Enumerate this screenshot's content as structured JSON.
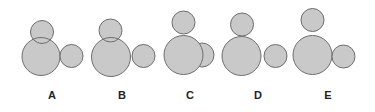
{
  "figure": {
    "style": {
      "circle_fill": "#c9c9c9",
      "circle_stroke": "#6e6e6e",
      "label_color": "#222222"
    },
    "options": [
      {
        "label": "A",
        "label_x": 52,
        "label_y": 99,
        "circles": [
          {
            "role": "large",
            "cx": 41,
            "cy": 56.5,
            "r": 19
          },
          {
            "role": "right",
            "cx": 71.5,
            "cy": 56,
            "r": 11.5
          },
          {
            "role": "top",
            "cx": 42,
            "cy": 32,
            "r": 11.5,
            "overlaps_large": true
          }
        ]
      },
      {
        "label": "B",
        "label_x": 122,
        "label_y": 99,
        "circles": [
          {
            "role": "large",
            "cx": 111,
            "cy": 57,
            "r": 19.5
          },
          {
            "role": "right",
            "cx": 143.5,
            "cy": 56,
            "r": 11.5
          },
          {
            "role": "top",
            "cx": 110.5,
            "cy": 30.5,
            "r": 11.5,
            "overlaps_large": true
          }
        ]
      },
      {
        "label": "C",
        "label_x": 190,
        "label_y": 99,
        "circles": [
          {
            "role": "right",
            "cx": 202,
            "cy": 55,
            "r": 12
          },
          {
            "role": "top",
            "cx": 183.5,
            "cy": 22.5,
            "r": 11.5
          },
          {
            "role": "large",
            "cx": 183.5,
            "cy": 55,
            "r": 19.5
          }
        ]
      },
      {
        "label": "D",
        "label_x": 258,
        "label_y": 99,
        "circles": [
          {
            "role": "large",
            "cx": 241.5,
            "cy": 56,
            "r": 19.5
          },
          {
            "role": "right",
            "cx": 275.5,
            "cy": 56,
            "r": 11.5
          },
          {
            "role": "top",
            "cx": 242,
            "cy": 24.5,
            "r": 11.5
          }
        ]
      },
      {
        "label": "E",
        "label_x": 328,
        "label_y": 99,
        "circles": [
          {
            "role": "large",
            "cx": 312.5,
            "cy": 55,
            "r": 19.5
          },
          {
            "role": "right",
            "cx": 343.5,
            "cy": 56.5,
            "r": 11.5
          },
          {
            "role": "top",
            "cx": 312.5,
            "cy": 20,
            "r": 11.5
          }
        ]
      }
    ]
  }
}
